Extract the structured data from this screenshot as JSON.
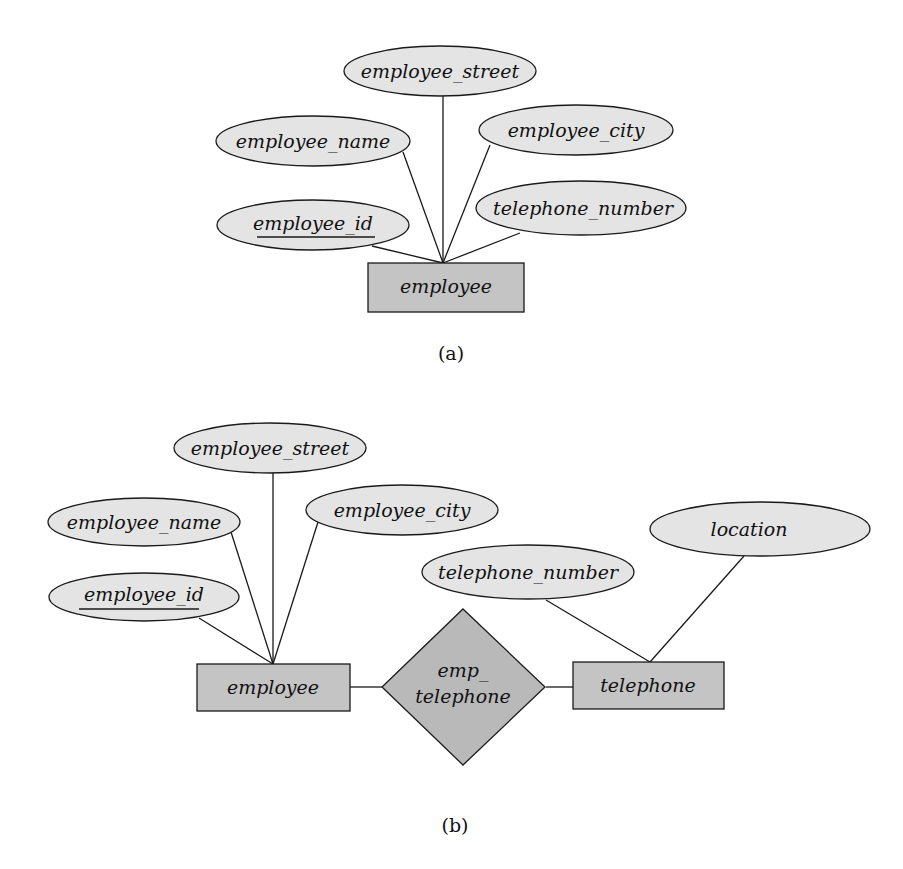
{
  "diagram_a": {
    "caption": "(a)",
    "entity": {
      "label": "employee"
    },
    "attributes": {
      "employee_street": "employee_street",
      "employee_name": "employee_name",
      "employee_city": "employee_city",
      "employee_id": "employee_id",
      "telephone_number": "telephone_number"
    },
    "primary_key": "employee_id"
  },
  "diagram_b": {
    "caption": "(b)",
    "entities": {
      "employee": "employee",
      "telephone": "telephone"
    },
    "relationship": {
      "line1": "emp_",
      "line2": "telephone"
    },
    "employee_attributes": {
      "employee_street": "employee_street",
      "employee_name": "employee_name",
      "employee_city": "employee_city",
      "employee_id": "employee_id"
    },
    "telephone_attributes": {
      "telephone_number": "telephone_number",
      "location": "location"
    },
    "primary_key": "employee_id"
  },
  "colors": {
    "attribute_fill": "#e4e4e4",
    "entity_fill": "#c4c4c4",
    "relationship_fill": "#b9b9b9",
    "stroke": "#1a1a1a"
  }
}
